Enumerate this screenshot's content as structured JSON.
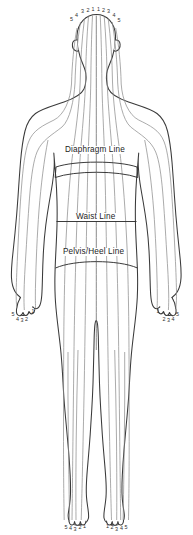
{
  "diagram": {
    "view": "posterior",
    "background_color": "#ffffff",
    "outline_color": "#3a3a3a",
    "zone_line_color": "#8a8a8a",
    "level_line_color": "#303030",
    "label_color": "#1d1d1d"
  },
  "level_lines": [
    {
      "id": "diaphragm",
      "label": "Diaphragm Line"
    },
    {
      "id": "waist",
      "label": "Waist Line"
    },
    {
      "id": "pelvis_heel",
      "label": "Pelvis/Heel Line"
    }
  ],
  "zone_numbers": {
    "head": [
      "5",
      "4",
      "3",
      "2",
      "1",
      "1",
      "2",
      "3",
      "4",
      "5"
    ],
    "left_hand": [
      "5",
      "4",
      "3",
      "2",
      "1"
    ],
    "right_hand": [
      "1",
      "2",
      "3",
      "4",
      "5"
    ],
    "left_foot": [
      "5",
      "4",
      "3",
      "2",
      "1"
    ],
    "right_foot": [
      "1",
      "2",
      "3",
      "4",
      "5"
    ]
  },
  "head_labels": [
    {
      "text": "5",
      "x": 71.5,
      "y": 21.0
    },
    {
      "text": "4",
      "x": 76.5,
      "y": 16.5
    },
    {
      "text": "3",
      "x": 82.5,
      "y": 13.2
    },
    {
      "text": "2",
      "x": 88.0,
      "y": 11.6
    },
    {
      "text": "1",
      "x": 93.0,
      "y": 11.0
    },
    {
      "text": "1",
      "x": 98.5,
      "y": 11.0
    },
    {
      "text": "2",
      "x": 103.5,
      "y": 11.6
    },
    {
      "text": "3",
      "x": 108.5,
      "y": 13.4
    },
    {
      "text": "4",
      "x": 114.0,
      "y": 17.0
    },
    {
      "text": "5",
      "x": 119.0,
      "y": 21.5
    }
  ],
  "left_hand_labels": [
    {
      "text": "5",
      "x": 13.0,
      "y": 316.0
    },
    {
      "text": "4",
      "x": 17.5,
      "y": 320.5
    },
    {
      "text": "3",
      "x": 22.0,
      "y": 322.0
    },
    {
      "text": "2",
      "x": 26.5,
      "y": 321.0
    },
    {
      "text": "1",
      "x": 33.0,
      "y": 313.0
    }
  ],
  "right_hand_labels": [
    {
      "text": "1",
      "x": 158.0,
      "y": 313.0
    },
    {
      "text": "2",
      "x": 164.0,
      "y": 321.0
    },
    {
      "text": "3",
      "x": 168.5,
      "y": 322.0
    },
    {
      "text": "4",
      "x": 173.0,
      "y": 320.5
    },
    {
      "text": "5",
      "x": 177.5,
      "y": 316.0
    }
  ],
  "left_foot_labels": [
    {
      "text": "5",
      "x": 66.0,
      "y": 528.5
    },
    {
      "text": "4",
      "x": 70.5,
      "y": 529.5
    },
    {
      "text": "3",
      "x": 75.0,
      "y": 530.5
    },
    {
      "text": "2",
      "x": 80.0,
      "y": 529.0
    },
    {
      "text": "1",
      "x": 84.5,
      "y": 528.0
    }
  ],
  "right_foot_labels": [
    {
      "text": "1",
      "x": 107.5,
      "y": 528.0
    },
    {
      "text": "2",
      "x": 112.0,
      "y": 529.0
    },
    {
      "text": "3",
      "x": 116.5,
      "y": 530.5
    },
    {
      "text": "4",
      "x": 121.5,
      "y": 529.5
    },
    {
      "text": "5",
      "x": 126.0,
      "y": 528.5
    }
  ]
}
